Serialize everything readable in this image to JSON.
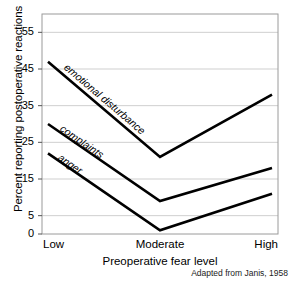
{
  "chart_data": {
    "type": "line",
    "title": "",
    "xlabel": "Preoperative fear level",
    "ylabel": "Percent reporting postoperative reactions",
    "categories": [
      "Low",
      "Moderate",
      "High"
    ],
    "xticklabels": [
      "Low",
      "Moderate",
      "High"
    ],
    "yticklabels": [
      "0",
      "5",
      "15",
      "25",
      "35",
      "45",
      "55"
    ],
    "yticks": [
      0,
      5,
      15,
      25,
      35,
      45,
      55
    ],
    "ylim": [
      0,
      60
    ],
    "grid": "horizontal",
    "legend": "inline-labels",
    "line_color": "#000000",
    "grid_color": "#cfcfcf",
    "frame_color": "#9a9a9a",
    "series": [
      {
        "name": "emotional disturbance",
        "label": "emotional disturbance",
        "values": [
          47,
          21,
          38
        ]
      },
      {
        "name": "complaints",
        "label": "complaints",
        "values": [
          30,
          9,
          18
        ]
      },
      {
        "name": "anger",
        "label": "anger",
        "values": [
          22,
          1,
          11
        ]
      }
    ],
    "annotations": [
      "Adapted from Janis, 1958"
    ]
  },
  "axis": {
    "y_title": "Percent reporting postoperative reactions",
    "x_title": "Preoperative fear level",
    "y_ticks": [
      {
        "value": 55,
        "label": "55"
      },
      {
        "value": 45,
        "label": "45"
      },
      {
        "value": 35,
        "label": "35"
      },
      {
        "value": 25,
        "label": "25"
      },
      {
        "value": 15,
        "label": "15"
      },
      {
        "value": 5,
        "label": "5"
      },
      {
        "value": 0,
        "label": "0"
      }
    ],
    "x_ticks": [
      {
        "label": "Low"
      },
      {
        "label": "Moderate"
      },
      {
        "label": "High"
      }
    ]
  },
  "labels": {
    "emotional_disturbance": "emotional disturbance",
    "complaints": "complaints",
    "anger": "anger"
  },
  "footer": {
    "source": "Adapted from Janis, 1958"
  }
}
